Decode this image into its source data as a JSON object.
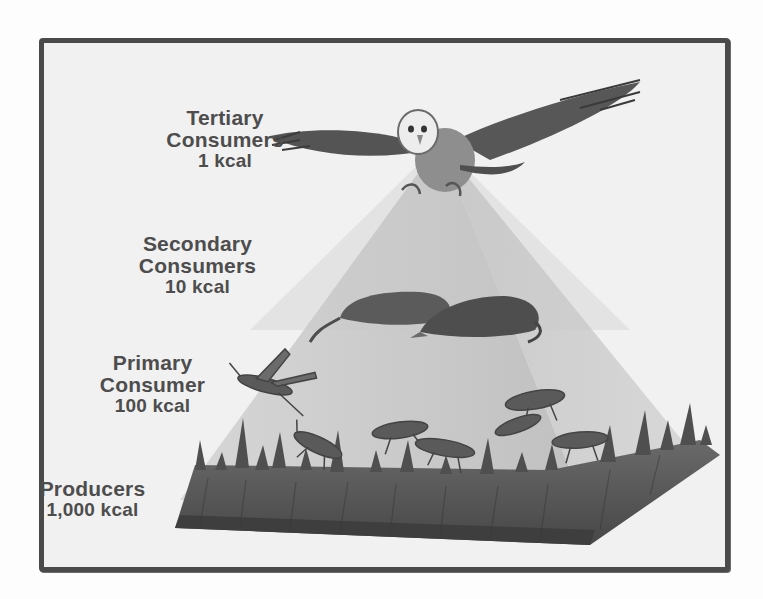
{
  "figure": {
    "background": "#f1f1f1",
    "border_color": "#4a4a4a",
    "pyramid_color": "#b9b9b9",
    "grass_color": "#555555"
  },
  "levels": [
    {
      "id": "tertiary",
      "name_line1": "Tertiary",
      "name_line2": "Consumers",
      "energy": "1 kcal",
      "organism": "owl"
    },
    {
      "id": "secondary",
      "name_line1": "Secondary",
      "name_line2": "Consumers",
      "energy": "10 kcal",
      "organism": "shrews"
    },
    {
      "id": "primary",
      "name_line1": "Primary",
      "name_line2": "Consumer",
      "energy": "100 kcal",
      "organism": "grasshoppers"
    },
    {
      "id": "producers",
      "name_line1": "Producers",
      "name_line2": "",
      "energy": "1,000 kcal",
      "organism": "grass"
    }
  ]
}
